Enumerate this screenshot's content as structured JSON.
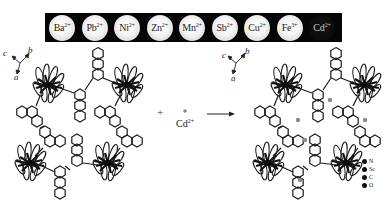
{
  "figure": {
    "strip": {
      "wells": [
        {
          "ion": "Ba",
          "charge": "2+",
          "state": "bright"
        },
        {
          "ion": "Pb",
          "charge": "2+",
          "state": "bright"
        },
        {
          "ion": "Ni",
          "charge": "2+",
          "state": "bright"
        },
        {
          "ion": "Zn",
          "charge": "2+",
          "state": "bright"
        },
        {
          "ion": "Mn",
          "charge": "2+",
          "state": "bright"
        },
        {
          "ion": "Sb",
          "charge": "2+",
          "state": "bright"
        },
        {
          "ion": "Cu",
          "charge": "2+",
          "state": "bright"
        },
        {
          "ion": "Fe",
          "charge": "3+",
          "state": "bright"
        },
        {
          "ion": "Cd",
          "charge": "2+",
          "state": "quenched"
        }
      ]
    },
    "left_structure": {
      "axes": {
        "c": "c",
        "b": "b",
        "a": "a"
      }
    },
    "reaction": {
      "plus": "+",
      "reagent": "Cd",
      "reagent_charge": "2+"
    },
    "right_structure": {
      "axes": {
        "c": "c",
        "b": "b",
        "a": "a"
      }
    },
    "legend": {
      "items": [
        "N",
        "Sc",
        "C",
        "O"
      ]
    },
    "colors": {
      "strip_background": "#050505",
      "bright_well": "#f4f4f4",
      "quenched_well": "#0b0b0b",
      "bond": "#1a1a1a",
      "cd_marker": "#8a8a8a"
    }
  }
}
